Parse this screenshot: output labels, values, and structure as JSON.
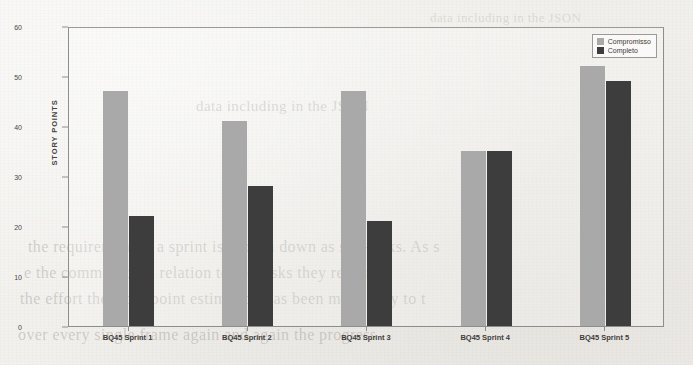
{
  "chart_data": {
    "type": "bar",
    "title": "",
    "xlabel": "",
    "ylabel": "STORY POINTS",
    "ylim": [
      0,
      60
    ],
    "yticks": [
      0,
      10,
      20,
      30,
      40,
      50,
      60
    ],
    "grid": false,
    "legend_position": "top-right",
    "categories": [
      "BQ45 Sprint 1",
      "BQ45 Sprint 2",
      "BQ45 Sprint 3",
      "BQ45 Sprint 4",
      "BQ45 Sprint 5"
    ],
    "series": [
      {
        "name": "Compromisso",
        "color": "#a9a9a9",
        "values": [
          47,
          41,
          47,
          35,
          52
        ]
      },
      {
        "name": "Completo",
        "color": "#3d3d3d",
        "values": [
          22,
          28,
          21,
          35,
          49
        ]
      }
    ]
  },
  "legend": {
    "items": [
      {
        "label": "Compromisso"
      },
      {
        "label": "Completo"
      }
    ]
  },
  "background_text": {
    "line1": "data including in the JSON",
    "line2": "the requirement in a sprint is broken down as sub-tasks. As s",
    "line3": "e the committed, in relation to the tasks they require",
    "line4": "the effort the story point estimation has been made easy to t",
    "line5": "over every single frame again and again the progress"
  }
}
